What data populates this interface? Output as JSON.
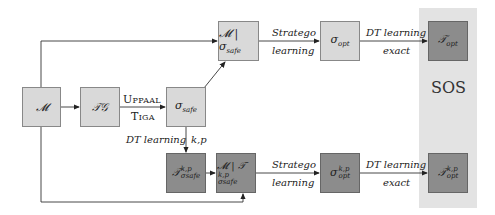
{
  "panel": {
    "label": "SOS",
    "color": "#e3e3e3"
  },
  "colors": {
    "light_box": "#d9d9d9",
    "dark_box": "#8c8c8c",
    "line": "#333333"
  },
  "nodes": {
    "model": {
      "base": "𝓜",
      "sub": "",
      "sup": ""
    },
    "tg": {
      "base": "𝒯𝒢",
      "sub": "",
      "sup": ""
    },
    "sigma_safe": {
      "base": "σ",
      "sub": "safe",
      "sup": ""
    },
    "m_sigma_safe": {
      "base": "𝓜 | σ",
      "sub": "safe",
      "sup": ""
    },
    "sigma_opt": {
      "base": "σ",
      "sub": "opt",
      "sup": ""
    },
    "t_opt": {
      "base": "𝒯",
      "sub": "opt",
      "sup": ""
    },
    "t_safe_kp": {
      "base": "𝒯",
      "sub": "σsafe",
      "sup": "k,p"
    },
    "m_t_safe_kp": {
      "base": "𝓜 | 𝒯",
      "sub": "σsafe",
      "sup": "k,p"
    },
    "sigma_opt_kp": {
      "base": "σ",
      "sub": "opt",
      "sup": "k,p"
    },
    "t_opt_kp": {
      "base": "𝒯",
      "sub": "opt",
      "sup": "k,p"
    }
  },
  "edges": {
    "uppaal_top": "Uppaal",
    "uppaal_bottom": "Tiga",
    "stratego_top": "Stratego",
    "stratego_bottom": "learning",
    "dt_top": "DT learning",
    "dt_bottom": "exact",
    "dt_left": "DT learning",
    "dt_right": "k,p",
    "stratego2_top": "Stratego",
    "stratego2_bottom": "learning",
    "dt2_top": "DT learning",
    "dt2_bottom": "exact"
  }
}
